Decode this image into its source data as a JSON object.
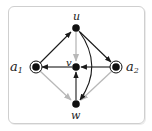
{
  "diagram": {
    "nodes": [
      {
        "id": "u",
        "label": "u",
        "x": 76,
        "y": 28,
        "double": false
      },
      {
        "id": "v",
        "label": "v",
        "x": 76,
        "y": 67,
        "double": false
      },
      {
        "id": "a1",
        "label": "a",
        "sub": "1",
        "x": 36,
        "y": 67,
        "double": true
      },
      {
        "id": "a2",
        "label": "a",
        "sub": "2",
        "x": 116,
        "y": 67,
        "double": true
      },
      {
        "id": "w",
        "label": "w",
        "x": 76,
        "y": 104,
        "double": false
      }
    ],
    "edges": [
      {
        "from": "a1",
        "to": "u",
        "color": "black"
      },
      {
        "from": "u",
        "to": "a2",
        "color": "black"
      },
      {
        "from": "u",
        "to": "v",
        "color": "gray"
      },
      {
        "from": "v",
        "to": "a1",
        "color": "black"
      },
      {
        "from": "a2",
        "to": "v",
        "color": "black"
      },
      {
        "from": "w",
        "to": "v",
        "color": "black"
      },
      {
        "from": "u",
        "to": "w",
        "color": "black",
        "curved": true
      },
      {
        "from": "a1",
        "to": "w",
        "color": "gray"
      },
      {
        "from": "a2",
        "to": "w",
        "color": "gray"
      }
    ],
    "colors": {
      "black": "#1a1a1a",
      "gray": "#b8b8b8",
      "frame": "#cfcfcf"
    }
  },
  "labels": {
    "u": "u",
    "v": "v",
    "a1": "a",
    "a1_sub": "1",
    "a2": "a",
    "a2_sub": "2",
    "w": "w"
  }
}
